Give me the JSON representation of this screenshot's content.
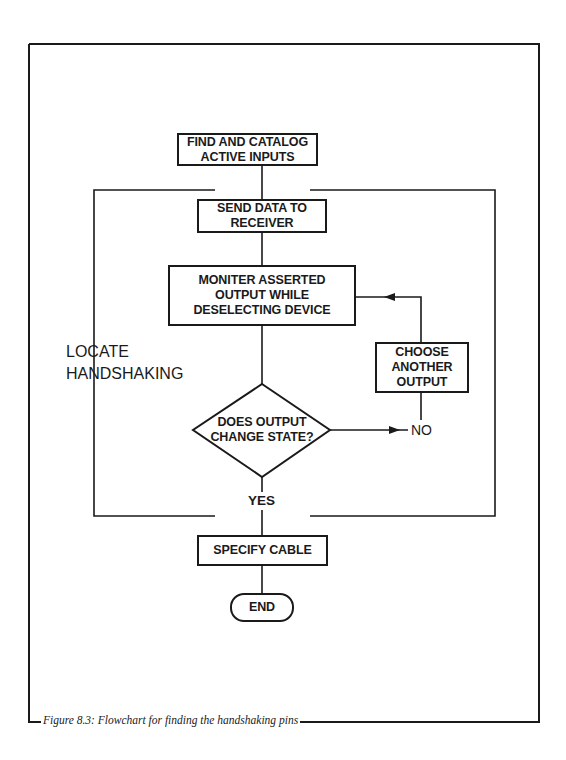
{
  "figure": {
    "caption": "Figure 8.3: Flowchart for finding the handshaking pins"
  },
  "flowchart": {
    "group_label": "LOCATE\nHANDSHAKING",
    "nodes": [
      {
        "id": "find-catalog",
        "type": "process",
        "text": "FIND AND CATALOG\nACTIVE INPUTS"
      },
      {
        "id": "send-data",
        "type": "process",
        "text": "SEND DATA TO\nRECEIVER"
      },
      {
        "id": "monitor-output",
        "type": "process",
        "text": "MONITER ASSERTED\nOUTPUT WHILE\nDESELECTING DEVICE"
      },
      {
        "id": "does-output-change",
        "type": "decision",
        "text": "DOES OUTPUT\nCHANGE STATE?"
      },
      {
        "id": "choose-another",
        "type": "process",
        "text": "CHOOSE\nANOTHER\nOUTPUT"
      },
      {
        "id": "specify-cable",
        "type": "process",
        "text": "SPECIFY CABLE"
      },
      {
        "id": "end",
        "type": "terminator",
        "text": "END"
      }
    ],
    "edge_labels": {
      "no": "NO",
      "yes": "YES"
    },
    "edges": [
      {
        "from": "find-catalog",
        "to": "send-data"
      },
      {
        "from": "send-data",
        "to": "monitor-output"
      },
      {
        "from": "monitor-output",
        "to": "does-output-change"
      },
      {
        "from": "does-output-change",
        "to": "choose-another",
        "label": "NO"
      },
      {
        "from": "choose-another",
        "to": "monitor-output"
      },
      {
        "from": "does-output-change",
        "to": "specify-cable",
        "label": "YES"
      },
      {
        "from": "specify-cable",
        "to": "end"
      }
    ]
  }
}
